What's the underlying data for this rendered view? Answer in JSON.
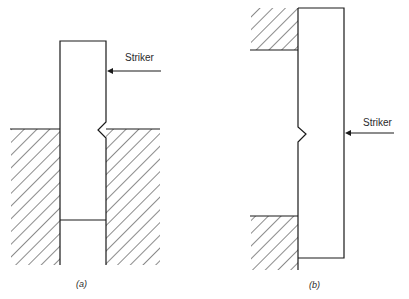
{
  "diagram": {
    "panels": [
      {
        "id": "a",
        "caption": "(a)",
        "striker_label": "Striker",
        "description": "Specimen clamped vertically between two hatched blocks; notch faces striker side above clamp"
      },
      {
        "id": "b",
        "caption": "(b)",
        "striker_label": "Striker",
        "description": "Specimen supported at top and bottom by hatched blocks; striker hits opposite side from notch at center"
      }
    ],
    "colors": {
      "line": "#1a1a1a",
      "background": "#ffffff"
    }
  }
}
